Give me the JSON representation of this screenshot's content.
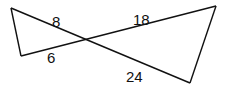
{
  "diagram": {
    "type": "bow-tie similar triangles",
    "stroke_color": "#111111",
    "labels": [
      {
        "id": "seg-top-left",
        "text": "8",
        "x": 52,
        "y": 27
      },
      {
        "id": "seg-bottom-left",
        "text": "6",
        "x": 47,
        "y": 63
      },
      {
        "id": "seg-top-right",
        "text": "18",
        "x": 133,
        "y": 25
      },
      {
        "id": "seg-bottom-right",
        "text": "24",
        "x": 126,
        "y": 82
      }
    ],
    "vertices": {
      "top_left": [
        11,
        8
      ],
      "bottom_left": [
        21,
        56
      ],
      "intersection": [
        85,
        40
      ],
      "top_right": [
        216,
        6
      ],
      "bottom_right": [
        190,
        83
      ]
    }
  }
}
